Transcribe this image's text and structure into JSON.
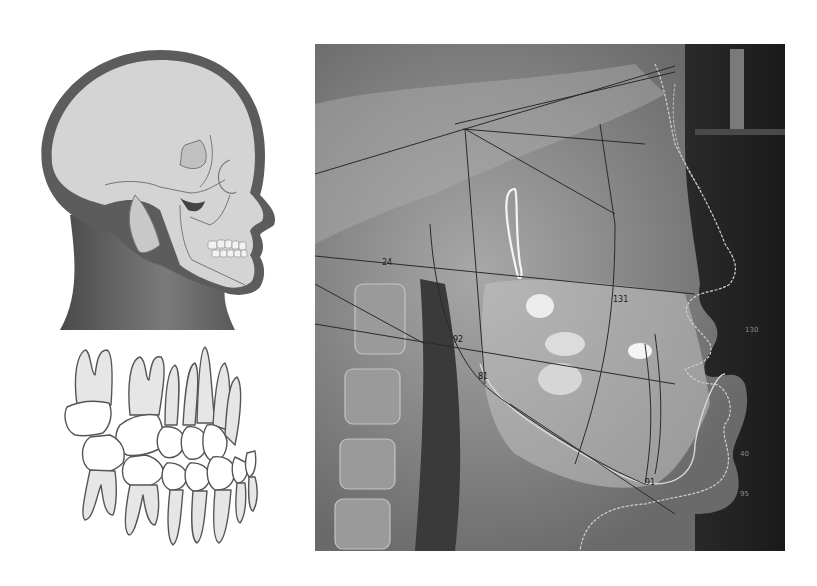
{
  "figure": {
    "panels": [
      {
        "id": "head-illustration",
        "description": "Lateral view of head with skull outline overlay"
      },
      {
        "id": "teeth-illustration",
        "description": "Lateral line drawing of occluded dentition"
      },
      {
        "id": "cephalogram",
        "description": "Lateral cephalometric radiograph with tracing lines"
      }
    ],
    "cephalogram_labels": {
      "label_1": "24",
      "label_2": "92",
      "label_3": "81",
      "label_4": "131",
      "label_5": "91",
      "label_6": "130",
      "label_7": "40",
      "label_8": "95"
    },
    "colors": {
      "background": "#ffffff",
      "skin_dark": "#5a5a5a",
      "skull_fill": "#d3d3d3",
      "xray_bg": "#6d6d6d",
      "soft_tissue_bg": "#1e1e1e",
      "tracing_line": "#2a2a2a",
      "tooth_fill": "#e6e6e6",
      "tooth_stroke": "#555555"
    }
  }
}
